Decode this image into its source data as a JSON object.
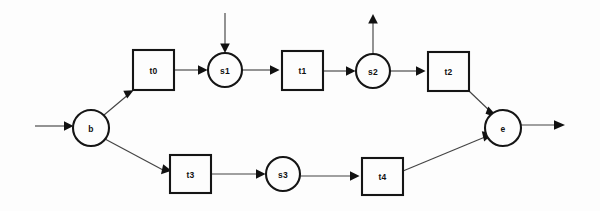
{
  "diagram": {
    "width": 600,
    "height": 211,
    "background_color": "#fdfdfd",
    "stroke_color": "#151515",
    "arc_color": "#444444",
    "places": [
      {
        "id": "b",
        "label": "b",
        "cx": 91,
        "cy": 128,
        "r": 18
      },
      {
        "id": "s1",
        "label": "s1",
        "cx": 225,
        "cy": 70,
        "r": 17
      },
      {
        "id": "s2",
        "label": "s2",
        "cx": 373,
        "cy": 71,
        "r": 17
      },
      {
        "id": "s3",
        "label": "s3",
        "cx": 283,
        "cy": 174,
        "r": 17
      },
      {
        "id": "e",
        "label": "e",
        "cx": 503,
        "cy": 128,
        "r": 18
      }
    ],
    "transitions": [
      {
        "id": "t0",
        "label": "t0",
        "x": 133,
        "y": 50,
        "w": 41,
        "h": 40
      },
      {
        "id": "t1",
        "label": "t1",
        "x": 282,
        "y": 51,
        "w": 41,
        "h": 39
      },
      {
        "id": "t2",
        "label": "t2",
        "x": 428,
        "y": 52,
        "w": 41,
        "h": 39
      },
      {
        "id": "t3",
        "label": "t3",
        "x": 170,
        "y": 155,
        "w": 41,
        "h": 38
      },
      {
        "id": "t4",
        "label": "t4",
        "x": 362,
        "y": 158,
        "w": 41,
        "h": 37
      }
    ],
    "arcs": [
      {
        "id": "arc-in-b",
        "from": "source",
        "to": "b",
        "kind": "input"
      },
      {
        "id": "arc-b-t0",
        "from": "b",
        "to": "t0",
        "kind": "internal"
      },
      {
        "id": "arc-t0-s1",
        "from": "t0",
        "to": "s1",
        "kind": "internal"
      },
      {
        "id": "arc-in-s1",
        "from": "source",
        "to": "s1",
        "kind": "input"
      },
      {
        "id": "arc-s1-t1",
        "from": "s1",
        "to": "t1",
        "kind": "internal"
      },
      {
        "id": "arc-t1-s2",
        "from": "t1",
        "to": "s2",
        "kind": "internal"
      },
      {
        "id": "arc-s2-out",
        "from": "s2",
        "to": "sink",
        "kind": "output"
      },
      {
        "id": "arc-s2-t2",
        "from": "s2",
        "to": "t2",
        "kind": "internal"
      },
      {
        "id": "arc-t2-e",
        "from": "t2",
        "to": "e",
        "kind": "internal"
      },
      {
        "id": "arc-b-t3",
        "from": "b",
        "to": "t3",
        "kind": "internal"
      },
      {
        "id": "arc-t3-s3",
        "from": "t3",
        "to": "s3",
        "kind": "internal"
      },
      {
        "id": "arc-s3-t4",
        "from": "s3",
        "to": "t4",
        "kind": "internal"
      },
      {
        "id": "arc-t4-e",
        "from": "t4",
        "to": "e",
        "kind": "internal"
      },
      {
        "id": "arc-e-out",
        "from": "e",
        "to": "sink",
        "kind": "output"
      }
    ]
  }
}
